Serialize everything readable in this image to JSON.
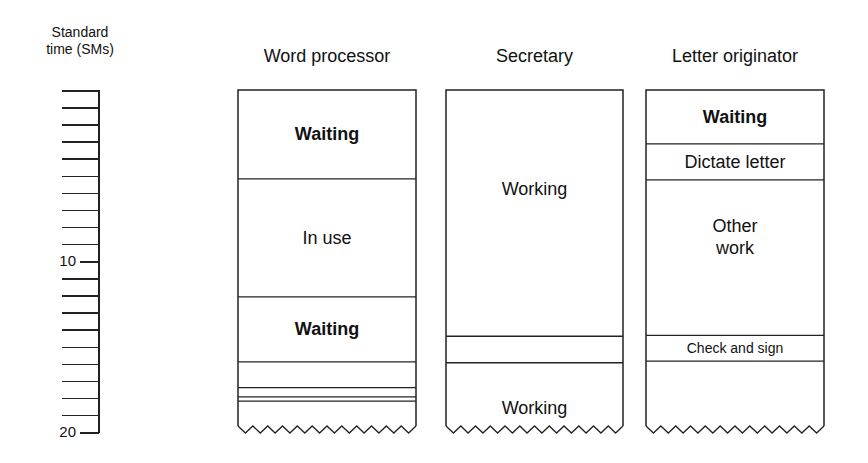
{
  "axis": {
    "title_line1": "Standard",
    "title_line2": "time (SMs)",
    "unit": "SMs",
    "min": 0,
    "max": 20,
    "tick_step": 1,
    "labels": [
      {
        "value": 10,
        "text": "10"
      },
      {
        "value": 20,
        "text": "20"
      }
    ]
  },
  "columns": [
    {
      "id": "word-processor",
      "header": "Word processor",
      "segments": [
        {
          "label": "Waiting",
          "start": 0,
          "end": 5.2,
          "bold": true
        },
        {
          "label": "In use",
          "start": 5.2,
          "end": 12.1,
          "bold": false
        },
        {
          "label": "Waiting",
          "start": 12.1,
          "end": 15.9,
          "bold": true
        },
        {
          "label": "",
          "start": 15.9,
          "end": 17.4
        },
        {
          "label": "",
          "start": 17.4,
          "end": 17.95
        },
        {
          "label": "",
          "start": 17.95,
          "end": 18.2
        },
        {
          "label": "",
          "start": 18.2,
          "end": 20,
          "open_end": true
        }
      ]
    },
    {
      "id": "secretary",
      "header": "Secretary",
      "segments": [
        {
          "label": "Working",
          "start": 0,
          "end": 14.4,
          "bold": false,
          "label_at": 5.8
        },
        {
          "label": "",
          "start": 14.4,
          "end": 15.95
        },
        {
          "label": "Working",
          "start": 15.95,
          "end": 20,
          "bold": false,
          "open_end": true,
          "label_at": 18.6
        }
      ]
    },
    {
      "id": "letter-originator",
      "header": "Letter originator",
      "segments": [
        {
          "label": "Waiting",
          "start": 0,
          "end": 3.15,
          "bold": true
        },
        {
          "label": "Dictate letter",
          "start": 3.15,
          "end": 5.25,
          "bold": false
        },
        {
          "label": "Other\nwork",
          "start": 5.25,
          "end": 14.35,
          "bold": false,
          "label_at": 8.6
        },
        {
          "label": "Check and sign",
          "start": 14.35,
          "end": 15.85,
          "bold": false,
          "small": true
        },
        {
          "label": "",
          "start": 15.85,
          "end": 20,
          "open_end": true
        }
      ]
    }
  ],
  "layout_cols": [
    {
      "left": 238,
      "width": 178
    },
    {
      "left": 446,
      "width": 177
    },
    {
      "left": 646,
      "width": 178
    }
  ]
}
